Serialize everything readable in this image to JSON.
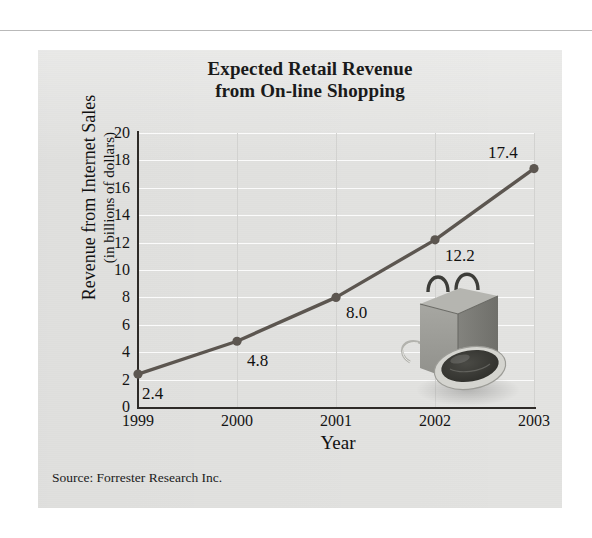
{
  "figure": {
    "title_line1": "Expected Retail Revenue",
    "title_line2": "from On-line Shopping",
    "source_note": "Source: Forrester Research Inc.",
    "panel_color": "#e3e3e1",
    "line_color": "#5c5650",
    "marker_color": "#5c5650",
    "gridline_color_horizontal": "#fbfbfb",
    "gridline_color_vertical": "#d2d2d0",
    "axis_color": "#2e2b28",
    "text_color": "#141414"
  },
  "ylabel": {
    "line1": "Revenue from Internet Sales",
    "line2": "(in billions of dollars)"
  },
  "xlabel": "Year",
  "illustration": {
    "name": "shopping-bag-and-mouse",
    "bag_color": "#9a9a96",
    "bag_side_color": "#7f7f7b",
    "mouse_body_color": "#cfcfcb",
    "mouse_top_color": "#3a3a36"
  },
  "chart_data": {
    "type": "line",
    "title": "Expected Retail Revenue from On-line Shopping",
    "xlabel": "Year",
    "ylabel": "Revenue from Internet Sales (in billions of dollars)",
    "categories": [
      "1999",
      "2000",
      "2001",
      "2002",
      "2003"
    ],
    "values": [
      2.4,
      4.8,
      8.0,
      12.2,
      17.4
    ],
    "point_labels": [
      "2.4",
      "4.8",
      "8.0",
      "12.2",
      "17.4"
    ],
    "ylim": [
      0,
      20
    ],
    "yticks": [
      0,
      2,
      4,
      6,
      8,
      10,
      12,
      14,
      16,
      18,
      20
    ],
    "ytick_labels": [
      "0",
      "2",
      "4",
      "6",
      "8",
      "10",
      "12",
      "14",
      "16",
      "18",
      "20"
    ],
    "xtick_labels": [
      "1999",
      "2000",
      "2001",
      "2002",
      "2003"
    ],
    "grid": true,
    "legend": false,
    "series": [
      {
        "name": "Revenue from Internet Sales",
        "values": [
          2.4,
          4.8,
          8.0,
          12.2,
          17.4
        ]
      }
    ],
    "annotations": [
      "Source: Forrester Research Inc."
    ]
  }
}
